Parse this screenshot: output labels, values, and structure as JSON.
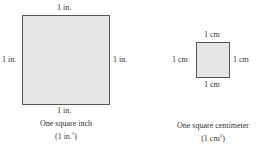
{
  "square_inch": {
    "top_label": "1 in.",
    "left_label": "1 in.",
    "right_label": "1 in.",
    "bottom_label": "1 in.",
    "caption_line1": "One square inch",
    "caption_unit": "(1 in.",
    "caption_sup": "2",
    "caption_close": ")",
    "fill_color": "#e6e6e6"
  },
  "square_centimeter": {
    "top_label": "1 cm",
    "left_label": "1 cm",
    "right_label": "1 cm",
    "bottom_label": "1 cm",
    "caption_line1": "One square centimeter",
    "caption_unit": "(1 cm",
    "caption_sup": "2",
    "caption_close": ")",
    "fill_color": "#e6e6e6"
  }
}
